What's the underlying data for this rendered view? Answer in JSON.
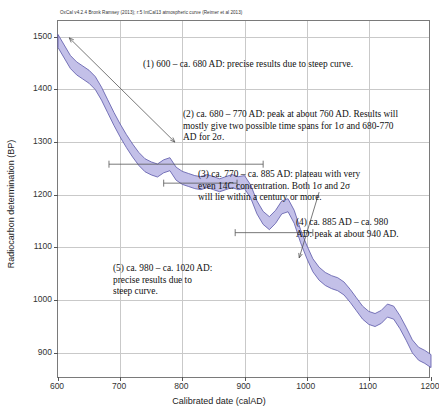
{
  "header": {
    "oxcal_credit": "OxCal v4.2.4 Bronk Ramsey (2013); r:5 IntCal13 atmospheric curve (Reimer et al 2013)"
  },
  "annotations": [
    {
      "id": "note-1",
      "text": "(1) 600 – ca. 680 AD: precise results due to steep curve."
    },
    {
      "id": "note-2",
      "text": "(2) ca. 680 – 770 AD: peak at about 760 AD. Results will\nmostly give two possible time spans for 1σ and 680-770\nAD for 2σ."
    },
    {
      "id": "note-3",
      "text": "(3) ca. 770 – ca. 885 AD: plateau with very\neven 14C concentration. Both 1σ and 2σ\nwill lie within a century or more."
    },
    {
      "id": "note-4",
      "text": "(4) ca. 885 AD – ca. 980\nAD: peak at about 940 AD."
    },
    {
      "id": "note-5",
      "text": "(5) ca. 980 – ca. 1020 AD:\nprecise results due to\nsteep curve."
    }
  ],
  "chart_data": {
    "type": "line",
    "title": "",
    "subtitle": "OxCal v4.2.4 Bronk Ramsey (2013); r:5 IntCal13 atmospheric curve (Reimer et al 2013)",
    "xlabel": "Calibrated date (calAD)",
    "ylabel": "Radiocarbon determination (BP)",
    "xlim": [
      600,
      1200
    ],
    "ylim": [
      850,
      1530
    ],
    "xticks": [
      600,
      700,
      800,
      900,
      1000,
      1100,
      1200
    ],
    "yticks": [
      900,
      1000,
      1100,
      1200,
      1300,
      1400,
      1500
    ],
    "grid": true,
    "legend": "none",
    "band_color": "#c3c0e8",
    "band_edge_color": "#5a57a8",
    "series": [
      {
        "name": "IntCal13 atmospheric curve (mean)",
        "x": [
          600,
          610,
          620,
          630,
          640,
          650,
          660,
          670,
          680,
          690,
          700,
          710,
          720,
          730,
          740,
          750,
          760,
          770,
          780,
          790,
          800,
          810,
          820,
          830,
          840,
          850,
          860,
          870,
          880,
          890,
          900,
          910,
          920,
          930,
          940,
          950,
          960,
          970,
          980,
          990,
          1000,
          1010,
          1020,
          1030,
          1040,
          1050,
          1060,
          1070,
          1080,
          1090,
          1100,
          1110,
          1120,
          1130,
          1140,
          1150,
          1160,
          1170,
          1180,
          1190,
          1200
        ],
        "values": [
          1492,
          1472,
          1452,
          1440,
          1432,
          1424,
          1412,
          1392,
          1368,
          1344,
          1322,
          1302,
          1284,
          1268,
          1256,
          1250,
          1246,
          1254,
          1258,
          1240,
          1232,
          1228,
          1224,
          1222,
          1226,
          1222,
          1218,
          1222,
          1226,
          1222,
          1224,
          1206,
          1176,
          1156,
          1146,
          1158,
          1176,
          1180,
          1158,
          1122,
          1092,
          1066,
          1050,
          1040,
          1034,
          1030,
          1022,
          1008,
          992,
          976,
          966,
          962,
          968,
          980,
          976,
          958,
          936,
          912,
          898,
          892,
          884
        ]
      }
    ],
    "markers": [
      {
        "name": "region-1-arrow",
        "kind": "double-arrow",
        "x1": 618,
        "y1": 1498,
        "x2": 788,
        "y2": 1300
      },
      {
        "name": "region-2-span",
        "kind": "horizontal-span",
        "x1": 682,
        "y1": 1258,
        "x2": 930
      },
      {
        "name": "region-3-plateau-line",
        "kind": "horizontal-span",
        "x1": 770,
        "y1": 1222,
        "x2": 888
      },
      {
        "name": "region-4-span",
        "kind": "horizontal-span",
        "x1": 885,
        "y1": 1128,
        "x2": 1010
      },
      {
        "name": "region-5-arrow",
        "kind": "single-arrow",
        "x1": 1020,
        "y1": 1205,
        "x2": 988,
        "y2": 1080
      }
    ],
    "annotated_regions": [
      {
        "label": "(1)",
        "from": 600,
        "to": 680,
        "note": "precise results due to steep curve"
      },
      {
        "label": "(2)",
        "from": 680,
        "to": 770,
        "note": "peak at about 760 AD"
      },
      {
        "label": "(3)",
        "from": 770,
        "to": 885,
        "note": "plateau, even 14C concentration"
      },
      {
        "label": "(4)",
        "from": 885,
        "to": 980,
        "note": "peak at about 940 AD"
      },
      {
        "label": "(5)",
        "from": 980,
        "to": 1020,
        "note": "precise results due to steep curve"
      }
    ]
  }
}
